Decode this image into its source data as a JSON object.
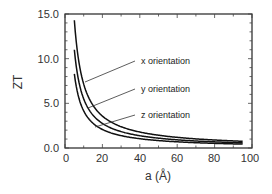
{
  "chart_data": {
    "type": "line",
    "title": "",
    "xlabel": "a (Å)",
    "ylabel": "ZT",
    "xlim": [
      0,
      100
    ],
    "ylim": [
      0,
      15
    ],
    "xticks": [
      "0",
      "20",
      "40",
      "60",
      "80",
      "100"
    ],
    "yticks": [
      "0.0",
      "5.0",
      "10.0",
      "15.0"
    ],
    "grid": false,
    "legend_position": "inline annotations with leader lines",
    "series": [
      {
        "name": "x orientation",
        "x": [
          5,
          7,
          10,
          15,
          20,
          30,
          40,
          60,
          80,
          95
        ],
        "values": [
          14.3,
          10.2,
          7.2,
          4.8,
          3.6,
          2.4,
          1.8,
          1.2,
          0.9,
          0.75
        ]
      },
      {
        "name": "y orientation",
        "x": [
          5,
          7,
          10,
          15,
          20,
          30,
          40,
          60,
          80,
          95
        ],
        "values": [
          11.0,
          7.9,
          5.5,
          3.7,
          2.8,
          1.8,
          1.4,
          0.9,
          0.7,
          0.58
        ]
      },
      {
        "name": "z orientation",
        "x": [
          5,
          7,
          10,
          15,
          20,
          30,
          40,
          60,
          80,
          95
        ],
        "values": [
          8.3,
          5.9,
          4.2,
          2.8,
          2.1,
          1.4,
          1.0,
          0.7,
          0.5,
          0.44
        ]
      }
    ]
  },
  "labels": {
    "ylabel": "ZT",
    "xlabel": "a (Å)",
    "x_tick_0": "0",
    "x_tick_20": "20",
    "x_tick_40": "40",
    "x_tick_60": "60",
    "x_tick_80": "80",
    "x_tick_100": "100",
    "y_tick_0": "0.0",
    "y_tick_5": "5.0",
    "y_tick_10": "10.0",
    "y_tick_15": "15.0",
    "anno_x": "x orientation",
    "anno_y": "y orientation",
    "anno_z": "z orientation"
  }
}
